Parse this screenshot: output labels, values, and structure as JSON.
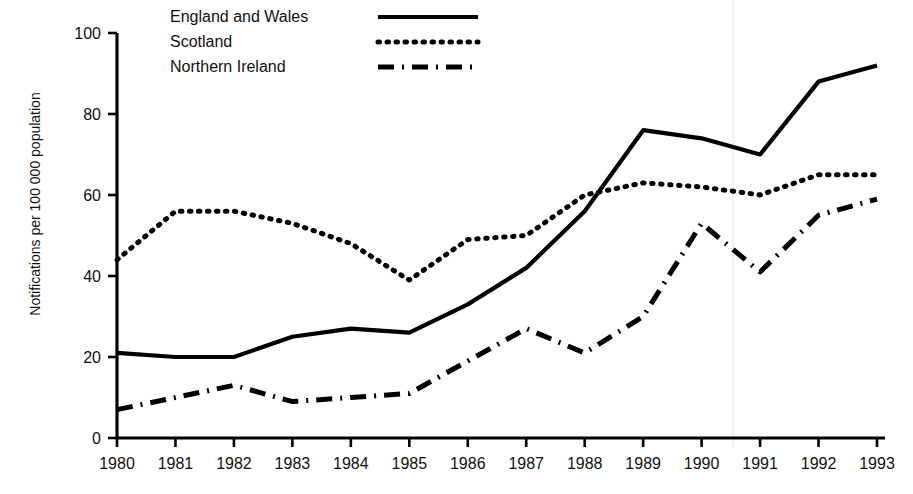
{
  "figure": {
    "clipped_header_text": "",
    "ylabel": "Notifications per 100 000 population"
  },
  "axes": {
    "y_ticks": [
      "0",
      "20",
      "40",
      "60",
      "80",
      "100"
    ],
    "x_ticks": [
      "1980",
      "1981",
      "1982",
      "1983",
      "1984",
      "1985",
      "1986",
      "1987",
      "1988",
      "1989",
      "1990",
      "1991",
      "1992",
      "1993"
    ]
  },
  "legend": {
    "items": [
      {
        "label": "England and Wales",
        "style": "solid"
      },
      {
        "label": "Scotland",
        "style": "dotted"
      },
      {
        "label": "Northern Ireland",
        "style": "dash-dot"
      }
    ]
  },
  "colors": {
    "line": "#000000",
    "axis": "#000000",
    "background": "#ffffff"
  },
  "chart_data": {
    "type": "line",
    "title": "",
    "xlabel": "",
    "ylabel": "Notifications per 100 000 population",
    "x": [
      1980,
      1981,
      1982,
      1983,
      1984,
      1985,
      1986,
      1987,
      1988,
      1989,
      1990,
      1991,
      1992,
      1993
    ],
    "categories": [
      "1980",
      "1981",
      "1982",
      "1983",
      "1984",
      "1985",
      "1986",
      "1987",
      "1988",
      "1989",
      "1990",
      "1991",
      "1992",
      "1993"
    ],
    "xlim": [
      1980,
      1993
    ],
    "ylim": [
      0,
      100
    ],
    "ytick_values": [
      0,
      20,
      40,
      60,
      80,
      100
    ],
    "grid": false,
    "legend_position": "top-left",
    "series": [
      {
        "name": "England and Wales",
        "style": "solid",
        "values": [
          21,
          20,
          20,
          25,
          27,
          26,
          33,
          42,
          56,
          76,
          74,
          70,
          88,
          92
        ]
      },
      {
        "name": "Scotland",
        "style": "dotted",
        "values": [
          44,
          56,
          56,
          53,
          48,
          39,
          49,
          50,
          60,
          63,
          62,
          60,
          65,
          65
        ]
      },
      {
        "name": "Northern Ireland",
        "style": "dash-dot",
        "values": [
          7,
          10,
          13,
          9,
          10,
          11,
          19,
          27,
          21,
          30,
          53,
          41,
          55,
          59
        ]
      }
    ]
  }
}
